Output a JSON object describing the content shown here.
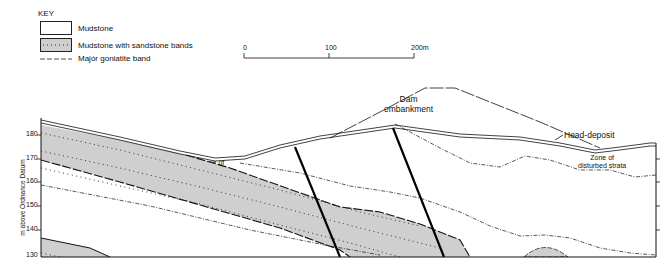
{
  "key": {
    "title": "KEY",
    "items": [
      {
        "label": "Mudstone",
        "pattern": "plain"
      },
      {
        "label": "Mudstone with sandstone bands",
        "pattern": "shaded-dotted"
      },
      {
        "label": "Majór goniatite band",
        "pattern": "dash-tick-line"
      }
    ]
  },
  "scale_bar": {
    "ticks": [
      "0",
      "100",
      "200m"
    ]
  },
  "axis": {
    "ylabel": "m above Ordnance Datum",
    "ticks": [
      "130",
      "140",
      "150",
      "160",
      "170",
      "180"
    ]
  },
  "labels": {
    "dam": [
      "Dam",
      "embankment"
    ],
    "head_deposit": "Head-deposit",
    "zone_left": [
      "Zone of",
      "disturbed",
      "strata"
    ],
    "zone_right": [
      "Zone of",
      "disturbed strata"
    ]
  },
  "colors": {
    "shade": "#cfcfcf",
    "line": "#111111"
  }
}
